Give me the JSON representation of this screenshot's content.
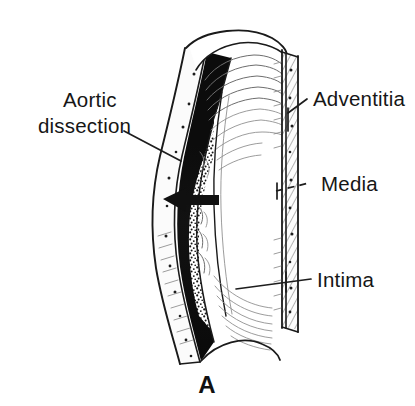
{
  "figure": {
    "panel_letter": "A",
    "background_color": "#ffffff",
    "ink_color": "#1a1a1a"
  },
  "labels": {
    "aortic_dissection": {
      "line1": "Aortic",
      "line2": "dissection",
      "leader_style": "solid",
      "side": "left"
    },
    "adventitia": {
      "text": "Adventitia",
      "leader_style": "solid",
      "side": "right"
    },
    "media": {
      "text": "Media",
      "leader_style": "dashed",
      "side": "right"
    },
    "intima": {
      "text": "Intima",
      "leader_style": "solid",
      "side": "right"
    }
  },
  "annotations": {
    "arrow": {
      "name": "dissection-arrow",
      "direction": "left",
      "color": "#101010"
    }
  },
  "layers": {
    "adventitia_fill": "#fbfbfb",
    "media_hatch": "#6d6d6d",
    "false_lumen_fill": "#0d0d0d",
    "stipple_color": "#1a1a1a",
    "lumen_fill": "#ffffff"
  }
}
